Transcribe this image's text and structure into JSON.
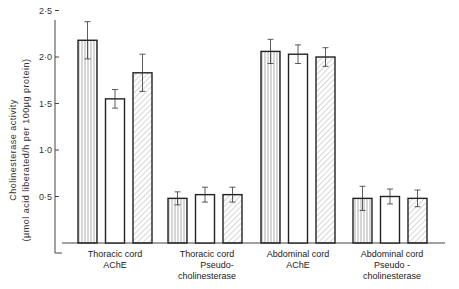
{
  "chart_data": {
    "type": "bar",
    "title": "",
    "xlabel": "",
    "ylabel": "Cholinesterase activity",
    "ylabel_units": "(µmol acid liberated/h per 100µg protein)",
    "ylim": [
      0,
      2.5
    ],
    "yticks": [
      "0·5",
      "1·0",
      "1·5",
      "2·0",
      "2·5"
    ],
    "ytick_values": [
      0.5,
      1.0,
      1.5,
      2.0,
      2.5
    ],
    "grid": false,
    "legend": null,
    "categories": [
      [
        "Thoracic cord",
        "AChE"
      ],
      [
        "Thoracic cord",
        "Pseudo-",
        "cholinesterase"
      ],
      [
        "Abdominal cord",
        "AChE"
      ],
      [
        "Abdominal cord",
        "Pseudo -",
        "cholinesterase"
      ]
    ],
    "series": [
      {
        "name": "vertical-hatch",
        "pattern": "vertical",
        "values": [
          2.18,
          0.48,
          2.06,
          0.48
        ],
        "errors": [
          0.2,
          0.07,
          0.13,
          0.13
        ]
      },
      {
        "name": "open",
        "pattern": "none",
        "values": [
          1.55,
          0.52,
          2.03,
          0.5
        ],
        "errors": [
          0.1,
          0.08,
          0.1,
          0.08
        ]
      },
      {
        "name": "diagonal-hatch",
        "pattern": "diagonal",
        "values": [
          1.83,
          0.52,
          2.0,
          0.48
        ],
        "errors": [
          0.2,
          0.08,
          0.1,
          0.09
        ]
      }
    ]
  },
  "axis": {
    "y_title_line1": "Cholinesterase activity",
    "y_title_line2": "(µmol acid liberated/h per 100µg protein)"
  }
}
